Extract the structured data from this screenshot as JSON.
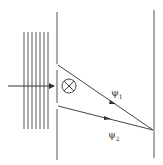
{
  "diagram": {
    "type": "double-slit interference with magnetic flux (Aharonov-Bohm)",
    "labels": {
      "path1": {
        "symbol": "ψ",
        "subscript": "1"
      },
      "path2": {
        "symbol": "ψ",
        "subscript": "2"
      }
    },
    "flux_symbol": "⊗",
    "colors": {
      "line": "#555555",
      "background": "#ffffff"
    }
  }
}
